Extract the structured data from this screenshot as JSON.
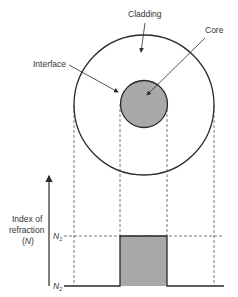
{
  "labels": {
    "cladding": "Cladding",
    "core": "Core",
    "interface": "Interface",
    "y_axis_line1": "Index of",
    "y_axis_line2": "refraction",
    "y_axis_line3": "(N)",
    "n1": "N",
    "n1_sub": "1",
    "n2": "N",
    "n2_sub": "2"
  },
  "colors": {
    "stroke": "#2a2a2a",
    "core_fill": "#a9a9a9",
    "dash": "#555555"
  }
}
